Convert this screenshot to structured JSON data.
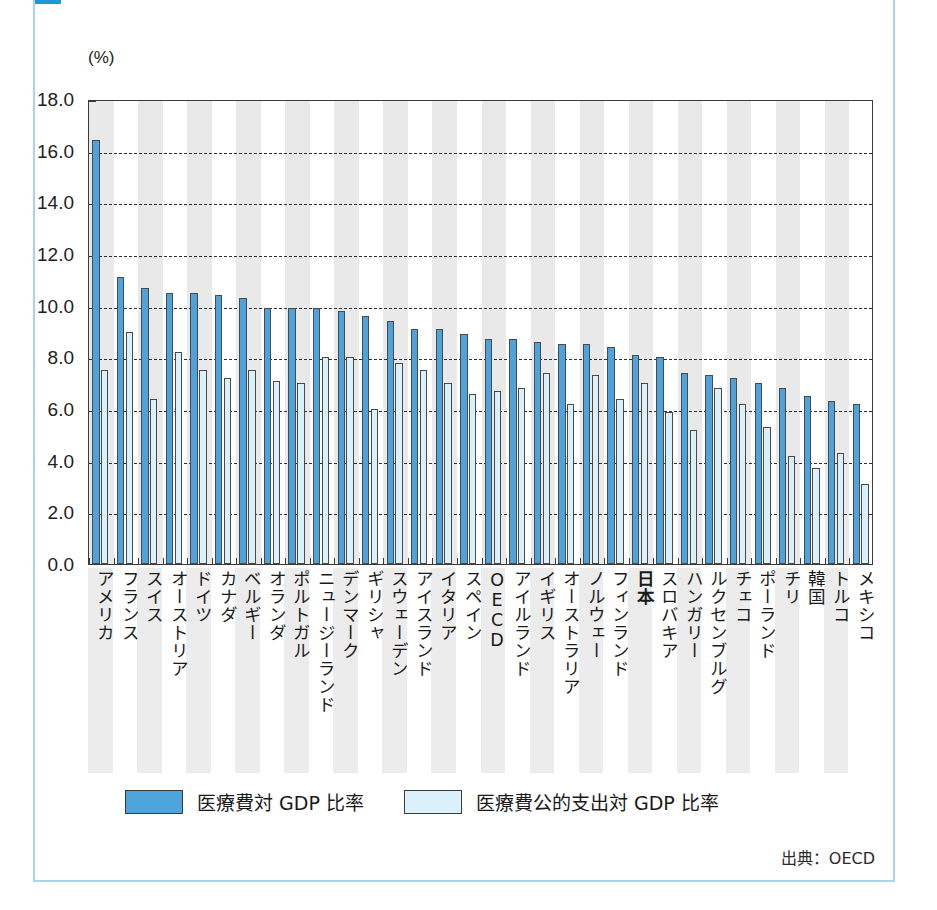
{
  "card": {
    "title": "",
    "accent_color": "#1a9ad8",
    "frame_color": "#a9d3e8"
  },
  "unit_label": "(%)",
  "source_label": "出典：OECD",
  "legend": {
    "position": "bottom",
    "items": [
      {
        "label": "医療費対 GDP 比率",
        "color": "#4fa3dc",
        "name": "total"
      },
      {
        "label": "医療費公的支出対 GDP 比率",
        "color": "#daf0fb",
        "name": "public"
      }
    ]
  },
  "axis": {
    "y_ticks": [
      "0.0",
      "2.0",
      "4.0",
      "6.0",
      "8.0",
      "10.0",
      "12.0",
      "14.0",
      "16.0",
      "18.0"
    ],
    "y_min": 0.0,
    "y_max": 18.0,
    "y_step": 2.0,
    "grid": "dashed-horizontal"
  },
  "highlight_category": "日本",
  "chart_data": {
    "type": "bar",
    "title": "",
    "xlabel": "",
    "ylabel": "(%)",
    "ylim": [
      0.0,
      18.0
    ],
    "grid": true,
    "legend_position": "bottom",
    "categories": [
      "アメリカ",
      "フランス",
      "スイス",
      "オーストリア",
      "ドイツ",
      "カナダ",
      "ベルギー",
      "オランダ",
      "ポルトガル",
      "ニュージーランド",
      "デンマーク",
      "ギリシャ",
      "スウェーデン",
      "アイスランド",
      "イタリア",
      "スペイン",
      "OECD",
      "アイルランド",
      "イギリス",
      "オーストラリア",
      "ノルウェー",
      "フィンランド",
      "日本",
      "スロバキア",
      "ハンガリー",
      "ルクセンブルグ",
      "チェコ",
      "ポーランド",
      "チリ",
      "韓国",
      "トルコ",
      "メキシコ"
    ],
    "series": [
      {
        "name": "医療費対 GDP 比率",
        "color": "#4fa3dc",
        "values": [
          16.4,
          11.1,
          10.7,
          10.5,
          10.5,
          10.4,
          10.3,
          9.9,
          9.9,
          9.9,
          9.8,
          9.6,
          9.4,
          9.1,
          9.1,
          8.9,
          8.7,
          8.7,
          8.6,
          8.5,
          8.5,
          8.4,
          8.1,
          8.0,
          7.4,
          7.3,
          7.2,
          7.0,
          6.8,
          6.5,
          6.3,
          6.2
        ]
      },
      {
        "name": "医療費公的支出対 GDP 比率",
        "color": "#daf0fb",
        "values": [
          7.5,
          9.0,
          6.4,
          8.2,
          7.5,
          7.2,
          7.5,
          7.1,
          7.0,
          8.0,
          8.0,
          6.0,
          7.8,
          7.5,
          7.0,
          6.6,
          6.7,
          6.8,
          7.4,
          6.2,
          7.3,
          6.4,
          7.0,
          5.9,
          5.2,
          6.8,
          6.2,
          5.3,
          4.2,
          3.7,
          4.3,
          3.1
        ]
      }
    ]
  }
}
